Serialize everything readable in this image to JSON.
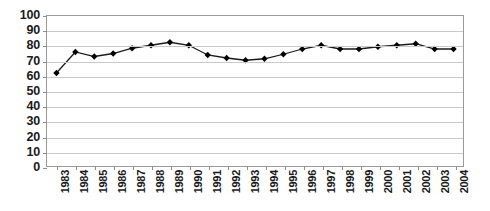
{
  "chart_data": {
    "type": "line",
    "title": "",
    "xlabel": "",
    "ylabel": "",
    "ylim": [
      0,
      100
    ],
    "ytick_step": 10,
    "yticks": [
      100,
      90,
      80,
      70,
      60,
      50,
      40,
      30,
      20,
      10,
      0
    ],
    "grid": true,
    "legend": "none",
    "marker": "diamond",
    "marker_color": "#000000",
    "line_color": "#1a1a1a",
    "categories": [
      "1983",
      "1984",
      "1985",
      "1986",
      "1987",
      "1988",
      "1989",
      "1990",
      "1991",
      "1992",
      "1993",
      "1994",
      "1995",
      "1996",
      "1997",
      "1998",
      "1999",
      "2000",
      "2001",
      "2002",
      "2003",
      "2004"
    ],
    "values": [
      62,
      76,
      73,
      75,
      78.5,
      80.5,
      82.5,
      80.5,
      74,
      72,
      70.5,
      71.5,
      74.5,
      78,
      80.5,
      78,
      78,
      79.5,
      80.5,
      81.5,
      78,
      78
    ]
  }
}
